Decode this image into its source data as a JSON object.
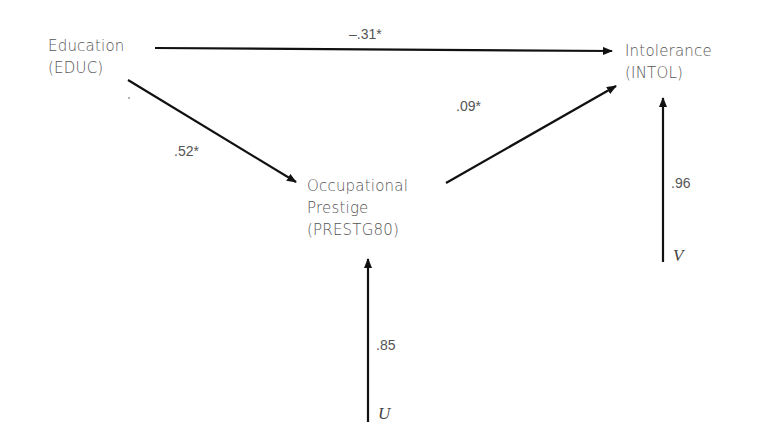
{
  "nodes": {
    "educ": {
      "line1": "Education",
      "line2": "(EDUC)"
    },
    "intol": {
      "line1": "Intolerance",
      "line2": "(INTOL)"
    },
    "prestg": {
      "line1": "Occupational",
      "line2": "Prestige",
      "line3": "(PRESTG80)"
    }
  },
  "paths": {
    "educ_intol": "–.31*",
    "educ_prestg": ".52*",
    "prestg_intol": ".09*",
    "u_prestg": ".85",
    "v_intol": ".96"
  },
  "errors": {
    "u": "U",
    "v": "V"
  }
}
